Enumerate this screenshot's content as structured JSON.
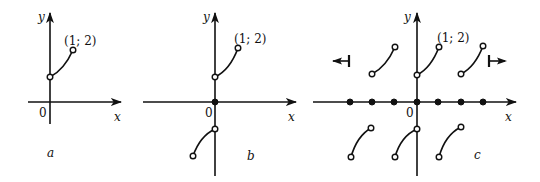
{
  "panels": [
    {
      "id": "a",
      "caption": "a",
      "origin_label": "0",
      "x_label": "x",
      "y_label": "y",
      "point_label": "(1; 2)"
    },
    {
      "id": "b",
      "caption": "b",
      "origin_label": "0",
      "x_label": "x",
      "y_label": "y",
      "point_label": "(1; 2)"
    },
    {
      "id": "c",
      "caption": "c",
      "origin_label": "0",
      "x_label": "x",
      "y_label": "y",
      "point_label": "(1; 2)"
    }
  ],
  "colors": {
    "ink": "#111111",
    "background": "#ffffff"
  }
}
